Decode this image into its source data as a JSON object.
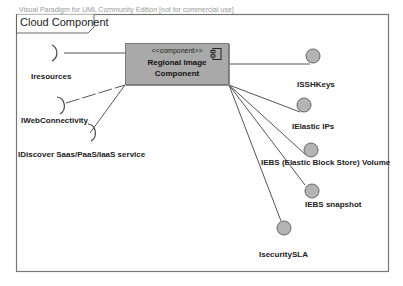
{
  "watermark": "Visual Paradigm for UML Community Edition [not for commercial use]",
  "frame": {
    "title": "Cloud Component"
  },
  "component": {
    "stereotype": "<<component>>",
    "name_line1": "Regional Image",
    "name_line2": "Component",
    "icon": "component-icon",
    "fill": "#a9a9a9"
  },
  "required_interfaces": [
    {
      "label": "Iresources"
    },
    {
      "label": "IWebConnectivity"
    },
    {
      "label": "IDiscover Saas/PaaS/IaaS service"
    }
  ],
  "provided_interfaces": [
    {
      "label": "ISSHKeys"
    },
    {
      "label": "IElastic IPs"
    },
    {
      "label": "IEBS (Elastic Block Store) Volume"
    },
    {
      "label": "IEBS snapshot"
    },
    {
      "label": "IsecuritySLA"
    }
  ],
  "colors": {
    "interface_fill": "#b4b4b4",
    "line": "#555555",
    "frame_border": "#777777"
  }
}
